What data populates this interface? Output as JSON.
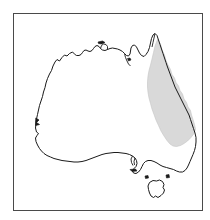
{
  "figure": {
    "kind": "distribution-map",
    "region_label": "Australia",
    "caption": "",
    "background_color": "#ffffff"
  },
  "frame": {
    "border_color": "#4a4a4a",
    "border_width_px": 1.6,
    "x": 13,
    "y": 13,
    "width": 190,
    "height": 198
  },
  "landmass": {
    "name": "Australia mainland",
    "outline_color": "#1a1a1a",
    "outline_width_px": 1.0,
    "fill_color": "#ffffff"
  },
  "islands": [
    {
      "name": "Tasmania",
      "outline_color": "#1a1a1a",
      "fill_color": "#ffffff"
    },
    {
      "name": "King Island",
      "outline_color": "#1a1a1a",
      "fill_color": "#1a1a1a"
    },
    {
      "name": "Flinders Island",
      "outline_color": "#1a1a1a",
      "fill_color": "#1a1a1a"
    },
    {
      "name": "Kangaroo Island",
      "outline_color": "#1a1a1a",
      "fill_color": "#1a1a1a"
    },
    {
      "name": "Melville Island",
      "outline_color": "#1a1a1a",
      "fill_color": "#1a1a1a"
    },
    {
      "name": "Groote Eylandt",
      "outline_color": "#1a1a1a",
      "fill_color": "#1a1a1a"
    }
  ],
  "distribution_overlay": {
    "label": "shaded distribution range",
    "fill_color": "#d9d9d9",
    "edge_color": "#c4c4c4",
    "extent_description": "Narrow band along the eastern seaboard, from Cape York Peninsula in the north to eastern Victoria in the south",
    "coverage_side": "east coast"
  },
  "legend": {
    "present": false,
    "items": []
  },
  "axes": {
    "present": false,
    "tick_labels": []
  }
}
